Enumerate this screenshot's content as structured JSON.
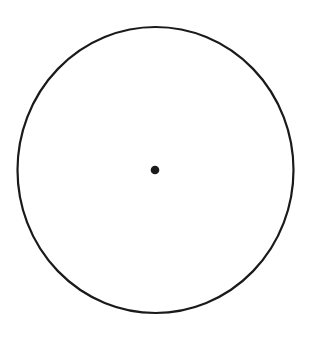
{
  "diagram": {
    "type": "circle-with-center-point",
    "background": "#ffffff",
    "stroke_color": "#1a1a1a",
    "circle": {
      "cx": 155.5,
      "cy": 170,
      "rx": 138,
      "ry": 143,
      "stroke_width": 2.2
    },
    "center_point": {
      "cx": 155,
      "cy": 170,
      "r": 4.3
    }
  }
}
